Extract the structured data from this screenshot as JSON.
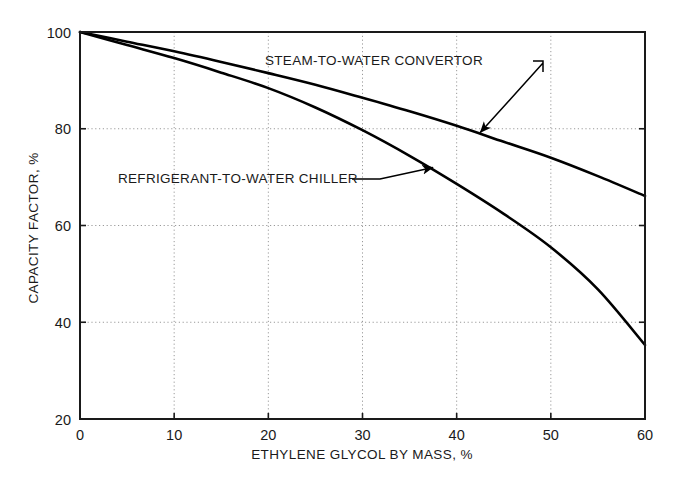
{
  "chart_data": {
    "type": "line",
    "title": "",
    "xlabel": "ETHYLENE GLYCOL BY MASS, %",
    "ylabel": "CAPACITY FACTOR, %",
    "xlim": [
      0,
      60
    ],
    "ylim": [
      20,
      100
    ],
    "xticks": [
      0,
      10,
      20,
      30,
      40,
      50,
      60
    ],
    "yticks": [
      20,
      40,
      60,
      80,
      100
    ],
    "xtick_labels": [
      "0",
      "10",
      "20",
      "30",
      "40",
      "50",
      "60"
    ],
    "ytick_labels": [
      "20",
      "40",
      "60",
      "80",
      "100"
    ],
    "grid": true,
    "grid_style": "dotted",
    "legend": "none",
    "line_color": "#000000",
    "grid_color": "#9a9a9a",
    "axis_color": "#1a1a1a",
    "background": "#ffffff",
    "x": [
      0,
      5,
      10,
      15,
      20,
      25,
      30,
      35,
      40,
      45,
      50,
      55,
      60
    ],
    "series": [
      {
        "name": "STEAM-TO-WATER CONVERTOR",
        "values": [
          100,
          98.0,
          96.0,
          93.8,
          91.5,
          89.1,
          86.4,
          83.6,
          80.6,
          77.3,
          74.0,
          70.2,
          66.1
        ]
      },
      {
        "name": "REFRIGERANT-TO-WATER CHILLER",
        "values": [
          100,
          97.3,
          94.6,
          91.6,
          88.4,
          84.4,
          79.7,
          74.4,
          68.6,
          62.4,
          55.5,
          46.8,
          35.3
        ]
      }
    ],
    "annotations": [
      {
        "text": "STEAM-TO-WATER CONVERTOR",
        "label_x": 265,
        "label_y": 65,
        "points_to_x": 42.5,
        "points_to_y": 79.2
      },
      {
        "text": "REFRIGERANT-TO-WATER CHILLER",
        "label_x": 118,
        "label_y": 183,
        "points_to_x": 37.5,
        "points_to_y": 72.0
      }
    ]
  }
}
